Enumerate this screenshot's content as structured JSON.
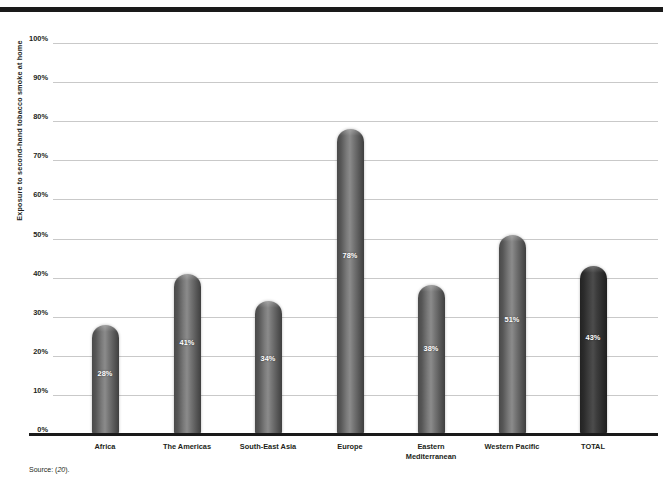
{
  "chart_data": {
    "type": "bar",
    "title": "",
    "subtitle": "",
    "xlabel": "",
    "ylabel": "Exposure to second-hand tobacco smoke at home",
    "ylim": [
      0,
      100
    ],
    "y_tick_labels": [
      "100%",
      "90%",
      "80%",
      "70%",
      "60%",
      "50%",
      "40%",
      "30%",
      "20%",
      "10%",
      "0%"
    ],
    "y_ticks": [
      100,
      90,
      80,
      70,
      60,
      50,
      40,
      30,
      20,
      10,
      0
    ],
    "grid": true,
    "legend": "none",
    "categories": [
      "Africa",
      "The Americas",
      "South-East Asia",
      "Europe",
      "Eastern\nMediterranean",
      "Western Pacific",
      "TOTAL"
    ],
    "values": [
      28,
      41,
      34,
      78,
      38,
      51,
      43
    ],
    "bar_labels": [
      "28%",
      "41%",
      "34%",
      "78%",
      "38%",
      "51%",
      "43%"
    ],
    "highlight_index": 6,
    "colors": {
      "bar": "#7b7b7b",
      "bar_highlight": "#3a3a3a",
      "axis": "#1a1a1a",
      "gridline": "#c9c9c9",
      "text": "#231f20",
      "bar_label": "#ffffff"
    }
  },
  "footer": {
    "source_prefix": "Source: (",
    "source_ref": "20",
    "source_suffix": ")."
  }
}
